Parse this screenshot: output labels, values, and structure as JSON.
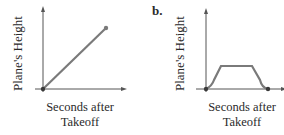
{
  "figure": {
    "panels": [
      {
        "letter": "",
        "ylabel": "Plane's Height",
        "xlabel_line1": "Seconds after",
        "xlabel_line2": "Takeoff",
        "shape": "straight increasing line from origin"
      },
      {
        "letter": "b.",
        "ylabel": "Plane's Height",
        "xlabel_line1": "Seconds after",
        "xlabel_line2": "Takeoff",
        "shape": "rise, level plateau, descend back to zero"
      }
    ],
    "colors": {
      "axis": "#555555",
      "curve": "#7a7a7a",
      "point": "#3a3a3a",
      "text": "#2a2a2a"
    }
  }
}
